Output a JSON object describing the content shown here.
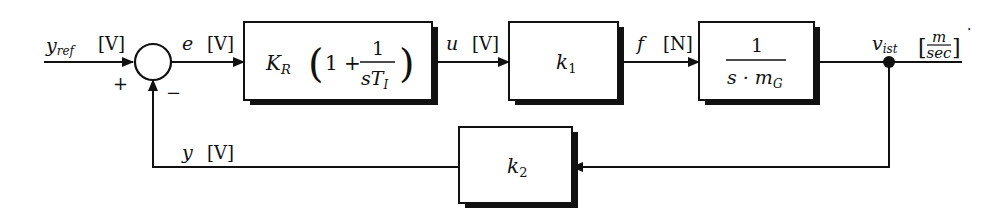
{
  "diagram": {
    "type": "control-loop-block-diagram",
    "colors": {
      "line": "#111111",
      "background": "#ffffff",
      "shadow": "#111111"
    },
    "input": {
      "symbol": "y",
      "subscript": "ref",
      "unit": "[V]"
    },
    "summing_junction": {
      "plus_sign": "+",
      "minus_sign": "−"
    },
    "signals": {
      "error": {
        "symbol": "e",
        "unit": "[V]"
      },
      "control": {
        "symbol": "u",
        "unit": "[V]"
      },
      "force": {
        "symbol": "f",
        "unit": "[N]"
      },
      "output": {
        "symbol": "v",
        "subscript": "ist",
        "unit_open": "[",
        "unit_num": "m",
        "unit_den": "sec",
        "unit_close": "]"
      },
      "feedback": {
        "symbol": "y",
        "unit": "[V]"
      }
    },
    "blocks": {
      "controller": {
        "gain": "K",
        "gain_sub": "R",
        "one_plus": "1 +",
        "num": "1",
        "den_s": "s",
        "den_T": "T",
        "den_sub": "I"
      },
      "actuator": {
        "symbol": "k",
        "sub": "1"
      },
      "plant": {
        "num": "1",
        "den_s": "s · m",
        "den_sub": "G"
      },
      "sensor": {
        "symbol": "k",
        "sub": "2"
      }
    },
    "stray_mark": "·"
  }
}
